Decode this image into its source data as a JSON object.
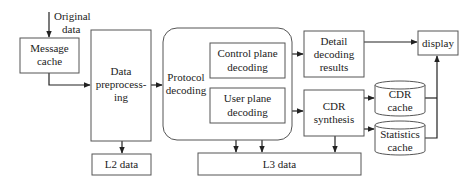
{
  "diagram": {
    "input_label": [
      "Original",
      "data"
    ],
    "nodes": {
      "message_cache": [
        "Message",
        "cache"
      ],
      "data_preprocessing": [
        "Data",
        "preprocess-",
        "ing"
      ],
      "l2_data": "L2 data",
      "protocol_decoding": [
        "Protocol",
        "decoding"
      ],
      "control_plane_decoding": [
        "Control plane",
        "decoding"
      ],
      "user_plane_decoding": [
        "User plane",
        "decoding"
      ],
      "detail_decoding_results": [
        "Detail",
        "decoding",
        "results"
      ],
      "display": "display",
      "cdr_synthesis": [
        "CDR",
        "synthesis"
      ],
      "cdr_cache": [
        "CDR",
        "cache"
      ],
      "statistics_cache": [
        "Statistics",
        "cache"
      ],
      "l3_data": "L3 data"
    },
    "edges": [
      {
        "from": "original_data",
        "to": "message_cache"
      },
      {
        "from": "message_cache",
        "to": "data_preprocessing"
      },
      {
        "from": "data_preprocessing",
        "to": "l2_data"
      },
      {
        "from": "data_preprocessing",
        "to": "protocol_decoding"
      },
      {
        "from": "control_plane_decoding",
        "to": "detail_decoding_results"
      },
      {
        "from": "user_plane_decoding",
        "to": "cdr_synthesis"
      },
      {
        "from": "user_plane_decoding",
        "to": "l3_data"
      },
      {
        "from": "user_plane_decoding",
        "to": "l3_data"
      },
      {
        "from": "detail_decoding_results",
        "to": "display"
      },
      {
        "from": "cdr_synthesis",
        "to": "cdr_cache"
      },
      {
        "from": "cdr_synthesis",
        "to": "statistics_cache"
      },
      {
        "from": "cdr_synthesis",
        "to": "l3_data"
      },
      {
        "from": "cdr_cache",
        "to": "display"
      },
      {
        "from": "statistics_cache",
        "to": "display"
      }
    ]
  }
}
